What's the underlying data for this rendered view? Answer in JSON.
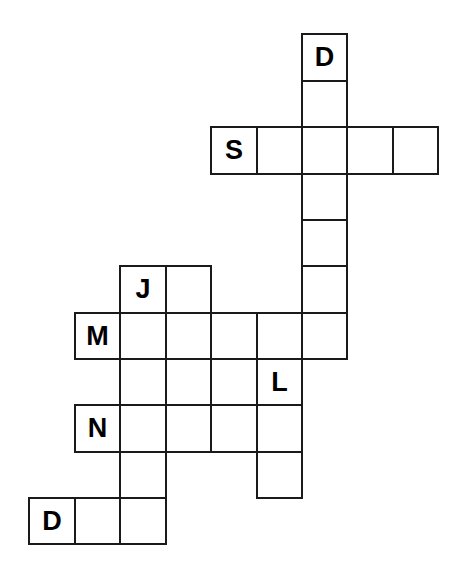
{
  "puzzle": {
    "title": "Crossword Puzzle Grid",
    "type": "crossword-grid",
    "background_color": "#ffffff",
    "cell_border_color": "#1a1a1a",
    "letter_color": "#000000",
    "cell_size": 45.5,
    "origin": {
      "x": 28,
      "y": 33
    },
    "columns": [
      28,
      74,
      119,
      165,
      210,
      256,
      301,
      346,
      392,
      437
    ],
    "rows": [
      33,
      80,
      126,
      173,
      219,
      265,
      312,
      358,
      404,
      451,
      497,
      543
    ],
    "grid_width_cells": 9,
    "grid_height_cells": 11,
    "given_letters": [
      "D",
      "S",
      "J",
      "M",
      "L",
      "N",
      "D"
    ],
    "cells": [
      {
        "id": "c6r0",
        "col": 6,
        "row": 0,
        "letter": "D"
      },
      {
        "id": "c6r1",
        "col": 6,
        "row": 1,
        "letter": ""
      },
      {
        "id": "c4r2",
        "col": 4,
        "row": 2,
        "letter": "S"
      },
      {
        "id": "c5r2",
        "col": 5,
        "row": 2,
        "letter": ""
      },
      {
        "id": "c6r2",
        "col": 6,
        "row": 2,
        "letter": ""
      },
      {
        "id": "c7r2",
        "col": 7,
        "row": 2,
        "letter": ""
      },
      {
        "id": "c8r2",
        "col": 8,
        "row": 2,
        "letter": ""
      },
      {
        "id": "c6r3",
        "col": 6,
        "row": 3,
        "letter": ""
      },
      {
        "id": "c6r4",
        "col": 6,
        "row": 4,
        "letter": ""
      },
      {
        "id": "c2r5",
        "col": 2,
        "row": 5,
        "letter": "J"
      },
      {
        "id": "c3r5",
        "col": 3,
        "row": 5,
        "letter": ""
      },
      {
        "id": "c6r5",
        "col": 6,
        "row": 5,
        "letter": ""
      },
      {
        "id": "c1r6",
        "col": 1,
        "row": 6,
        "letter": "M"
      },
      {
        "id": "c2r6",
        "col": 2,
        "row": 6,
        "letter": ""
      },
      {
        "id": "c3r6",
        "col": 3,
        "row": 6,
        "letter": ""
      },
      {
        "id": "c4r6",
        "col": 4,
        "row": 6,
        "letter": ""
      },
      {
        "id": "c5r6",
        "col": 5,
        "row": 6,
        "letter": ""
      },
      {
        "id": "c6r6",
        "col": 6,
        "row": 6,
        "letter": ""
      },
      {
        "id": "c2r7",
        "col": 2,
        "row": 7,
        "letter": ""
      },
      {
        "id": "c3r7",
        "col": 3,
        "row": 7,
        "letter": ""
      },
      {
        "id": "c5r7",
        "col": 5,
        "row": 7,
        "letter": "L"
      },
      {
        "id": "c1r8",
        "col": 1,
        "row": 8,
        "letter": "N"
      },
      {
        "id": "c2r8",
        "col": 2,
        "row": 8,
        "letter": ""
      },
      {
        "id": "c3r8",
        "col": 3,
        "row": 8,
        "letter": ""
      },
      {
        "id": "c4r8",
        "col": 4,
        "row": 8,
        "letter": ""
      },
      {
        "id": "c5r8",
        "col": 5,
        "row": 8,
        "letter": ""
      },
      {
        "id": "c2r9",
        "col": 2,
        "row": 9,
        "letter": ""
      },
      {
        "id": "c5r9",
        "col": 5,
        "row": 9,
        "letter": ""
      },
      {
        "id": "c0r10",
        "col": 0,
        "row": 10,
        "letter": "D"
      },
      {
        "id": "c1r10",
        "col": 1,
        "row": 10,
        "letter": ""
      },
      {
        "id": "c2r10",
        "col": 2,
        "row": 10,
        "letter": ""
      }
    ]
  }
}
